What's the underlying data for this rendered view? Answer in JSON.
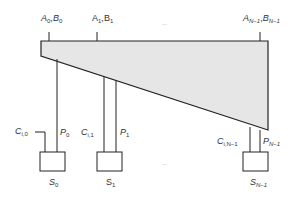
{
  "diagram": {
    "type": "prefix-carry-network",
    "colors": {
      "block_fill": "#e6e6e6",
      "stroke": "#222222",
      "text": "#333333"
    },
    "top_inputs": [
      {
        "label": "A0,B0",
        "var_a": "A",
        "sub_a": "0",
        "var_b": "B",
        "sub_b": "0"
      },
      {
        "label": "A1,B1",
        "var_a": "A",
        "sub_a": "1",
        "var_b": "B",
        "sub_b": "1"
      },
      {
        "label": "AN-1,BN-1",
        "var_a": "A",
        "sub_a": "N−1",
        "var_b": "B",
        "sub_b": "N−1"
      }
    ],
    "ellipsis_top": "...",
    "ellipsis_bottom": "...",
    "cells": [
      {
        "carry": "C",
        "carry_sub": "i,0",
        "prop": "P",
        "prop_sub": "0",
        "sum": "S",
        "sum_sub": "0"
      },
      {
        "carry": "C",
        "carry_sub": "i,1",
        "prop": "P",
        "prop_sub": "1",
        "sum": "S",
        "sum_sub": "1"
      },
      {
        "carry": "C",
        "carry_sub": "i,N−1",
        "prop": "P",
        "prop_sub": "N−1",
        "sum": "S",
        "sum_sub": "N−1"
      }
    ]
  }
}
